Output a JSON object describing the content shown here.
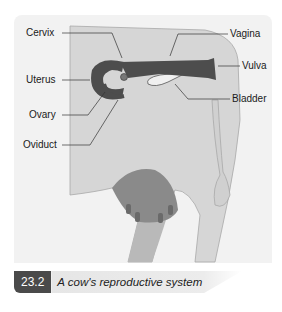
{
  "diagram": {
    "labels": {
      "cervix": "Cervix",
      "uterus": "Uterus",
      "ovary": "Ovary",
      "oviduct": "Oviduct",
      "vagina": "Vagina",
      "vulva": "Vulva",
      "bladder": "Bladder"
    },
    "colors": {
      "body": "#d8d8d8",
      "organs": "#4d4d4d",
      "udder": "#8a8a8a",
      "bladder": "#ececec"
    }
  },
  "caption": {
    "number": "23.2",
    "text": "A cow's reproductive system"
  }
}
